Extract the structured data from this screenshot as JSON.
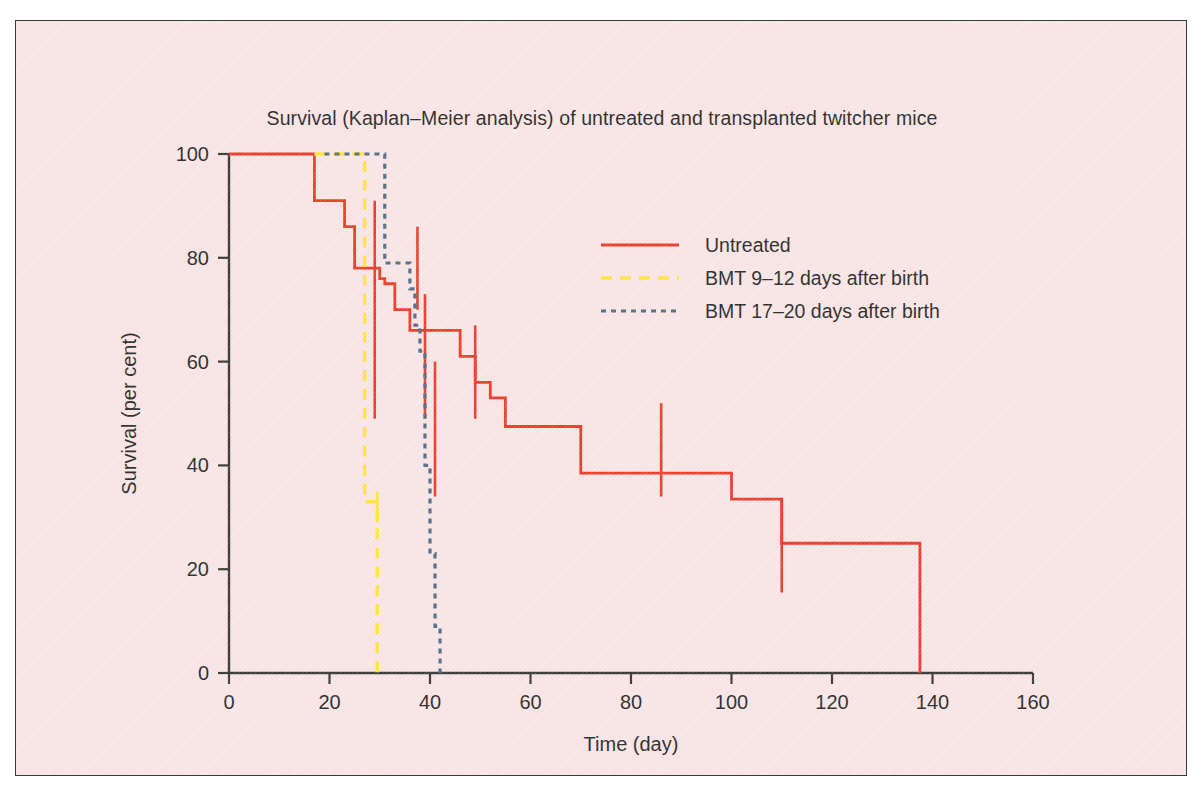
{
  "figure": {
    "background_color": "#f9e6e6",
    "border_color": "#3a3a3a",
    "title": "Survival (Kaplan–Meier analysis) of untreated and transplanted twitcher mice"
  },
  "legend": {
    "position": "upper-right-inside",
    "entries": [
      {
        "label": "Untreated",
        "color": "#e8301b",
        "style": "solid"
      },
      {
        "label": "BMT  9–12  days after birth",
        "color": "#ffe62e",
        "style": "dashed"
      },
      {
        "label": "BMT 17–20 days after birth",
        "color": "#46637f",
        "style": "dotted"
      }
    ]
  },
  "axes": {
    "x": {
      "title": "Time (day)",
      "ticks": [
        "0",
        "20",
        "40",
        "60",
        "80",
        "100",
        "120",
        "140",
        "160"
      ],
      "min": 0,
      "max": 160
    },
    "y": {
      "title": "Survival (per cent)",
      "ticks": [
        "0",
        "20",
        "40",
        "60",
        "80",
        "100"
      ],
      "min": 0,
      "max": 100
    }
  },
  "chart_data": {
    "type": "line",
    "title": "Survival (Kaplan–Meier analysis) of untreated and transplanted twitcher mice",
    "xlabel": "Time (day)",
    "ylabel": "Survival (per cent)",
    "xlim": [
      0,
      160
    ],
    "ylim": [
      0,
      100
    ],
    "grid": false,
    "legend_position": "upper right",
    "series": [
      {
        "name": "Untreated",
        "color": "#e8301b",
        "style": "solid",
        "step": "post",
        "points": [
          [
            0,
            100
          ],
          [
            17,
            100
          ],
          [
            17,
            91
          ],
          [
            23,
            91
          ],
          [
            23,
            86
          ],
          [
            25,
            86
          ],
          [
            25,
            78
          ],
          [
            30,
            78
          ],
          [
            30,
            76
          ],
          [
            31,
            76
          ],
          [
            31,
            75
          ],
          [
            33,
            75
          ],
          [
            33,
            70
          ],
          [
            36,
            70
          ],
          [
            36,
            66
          ],
          [
            46,
            66
          ],
          [
            46,
            61
          ],
          [
            49,
            61
          ],
          [
            49,
            56
          ],
          [
            52,
            56
          ],
          [
            52,
            53
          ],
          [
            55,
            53
          ],
          [
            55,
            47.5
          ],
          [
            70,
            47.5
          ],
          [
            70,
            38.5
          ],
          [
            100,
            38.5
          ],
          [
            100,
            33.5
          ],
          [
            110,
            33.5
          ],
          [
            110,
            25
          ],
          [
            137.5,
            25
          ],
          [
            137.5,
            0
          ]
        ],
        "censor_marks": [
          {
            "x": 29,
            "y": 70,
            "half_height": 21
          },
          {
            "x": 37.5,
            "y": 78,
            "half_height": 8
          },
          {
            "x": 39,
            "y": 61,
            "half_height": 12
          },
          {
            "x": 41,
            "y": 47,
            "half_height": 13
          },
          {
            "x": 49,
            "y": 58,
            "half_height": 9
          },
          {
            "x": 86,
            "y": 43,
            "half_height": 9
          },
          {
            "x": 110,
            "y": 24.5,
            "half_height": 9
          }
        ]
      },
      {
        "name": "BMT  9–12  days after birth",
        "color": "#ffe62e",
        "style": "dashed",
        "step": "post",
        "points": [
          [
            17,
            100
          ],
          [
            27,
            100
          ],
          [
            27,
            33
          ],
          [
            29.5,
            33
          ],
          [
            29.5,
            0
          ]
        ],
        "censor_marks": [
          {
            "x": 29.5,
            "y": 32,
            "half_height": 3
          }
        ]
      },
      {
        "name": "BMT 17–20 days after birth",
        "color": "#46637f",
        "style": "dotted",
        "step": "post",
        "points": [
          [
            19,
            100
          ],
          [
            31,
            100
          ],
          [
            31,
            79
          ],
          [
            36,
            79
          ],
          [
            36,
            74
          ],
          [
            37,
            74
          ],
          [
            37,
            67
          ],
          [
            38,
            67
          ],
          [
            38,
            62
          ],
          [
            39,
            62
          ],
          [
            39,
            40
          ],
          [
            40,
            40
          ],
          [
            40,
            23
          ],
          [
            41,
            23
          ],
          [
            41,
            9
          ],
          [
            42,
            9
          ],
          [
            42,
            0
          ]
        ],
        "censor_marks": []
      }
    ]
  }
}
